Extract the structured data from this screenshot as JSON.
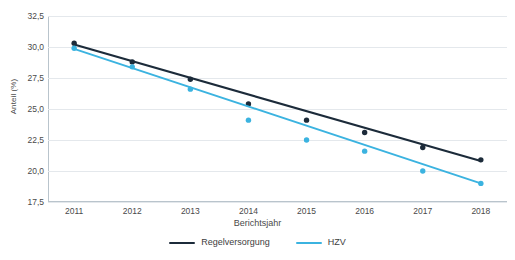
{
  "chart_data": {
    "type": "line",
    "title": "",
    "subtitle": "",
    "xlabel": "Berichtsjahr",
    "ylabel": "Anteil (%)",
    "categories": [
      "2011",
      "2012",
      "2013",
      "2014",
      "2015",
      "2016",
      "2017",
      "2018"
    ],
    "x": [
      2011,
      2012,
      2013,
      2014,
      2015,
      2016,
      2017,
      2018
    ],
    "xlim": [
      2010.55,
      2018.45
    ],
    "ylim": [
      17.5,
      32.5
    ],
    "yticks": [
      32.5,
      30.0,
      27.5,
      25.0,
      22.5,
      20.0,
      17.5
    ],
    "ytick_labels": [
      "32,5",
      "30,0",
      "27,5",
      "25,0",
      "22,5",
      "20,0",
      "17,5"
    ],
    "grid": true,
    "grid_axis": "y",
    "legend_position": "bottom",
    "series": [
      {
        "name": "Regelversorgung",
        "color": "#1c2b3a",
        "marker": "circle",
        "values": [
          30.3,
          28.8,
          27.4,
          25.4,
          24.1,
          23.1,
          21.9,
          20.9
        ],
        "trend_start": 30.2,
        "trend_end": 20.8
      },
      {
        "name": "HZV",
        "color": "#3bb3e0",
        "marker": "circle",
        "values": [
          29.9,
          28.4,
          26.6,
          24.1,
          22.5,
          21.6,
          20.0,
          19.0
        ],
        "trend_start": 29.85,
        "trend_end": 19.0
      }
    ]
  },
  "legend": {
    "items": [
      {
        "label": "Regelversorgung",
        "color": "#1c2b3a"
      },
      {
        "label": "HZV",
        "color": "#3bb3e0"
      }
    ]
  },
  "colors": {
    "regelversorgung": "#1c2b3a",
    "hzv": "#3bb3e0",
    "grid": "#e4e8ec",
    "axis": "#b9c4cc",
    "text": "#4a4a4a",
    "background": "#ffffff"
  }
}
